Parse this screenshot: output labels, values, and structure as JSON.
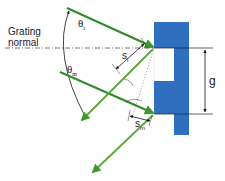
{
  "diagram": {
    "labels": {
      "grating_normal_line1": "Grating",
      "grating_normal_line2": "normal",
      "theta_i": "θ",
      "theta_i_sub": "i",
      "theta_m": "θ",
      "theta_m_sub": "m",
      "s_i": "s",
      "s_i_sub": "i",
      "s_m": "s",
      "s_m_sub": "m",
      "groove_spacing": "g"
    },
    "colors": {
      "grating_blue": "#2f6fc0",
      "ray_green": "#3a8a2a",
      "ray_green_light": "#5aa83a",
      "line_dark": "#222222",
      "background": "#ffffff"
    },
    "elements": [
      "grating profile (blue stepped)",
      "grating normal (dash-dot line)",
      "incident rays (2, green)",
      "diffracted rays (2, green)",
      "angle arc from theta_i to theta_m",
      "path difference segments s_i and s_m",
      "groove spacing dimension g"
    ]
  }
}
